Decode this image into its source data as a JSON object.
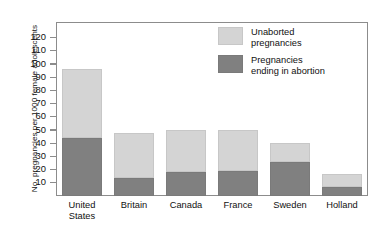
{
  "chart_data": {
    "type": "bar",
    "subtype": "stacked-bar",
    "title": "",
    "xlabel": "",
    "ylabel": "No. pregnancies per 1000 female adolescents",
    "ylim": [
      0,
      125
    ],
    "yticks": [
      10,
      20,
      30,
      40,
      50,
      60,
      70,
      80,
      90,
      100,
      110,
      120
    ],
    "ytick_labels": [
      "10",
      "20",
      "30",
      "40",
      "50",
      "60",
      "70",
      "80",
      "90",
      "100",
      "110",
      "120"
    ],
    "grid": false,
    "legend_position": "upper right (inside plot area)",
    "categories": [
      "United States",
      "Britain",
      "Canada",
      "France",
      "Sweden",
      "Holland"
    ],
    "category_label_lines": [
      [
        "United",
        "States"
      ],
      [
        "Britain",
        ""
      ],
      [
        "Canada",
        ""
      ],
      [
        "France",
        ""
      ],
      [
        "Sweden",
        ""
      ],
      [
        "Holland",
        ""
      ]
    ],
    "series": [
      {
        "name": "Pregnancies ending in abortion",
        "color": "#808080",
        "legend_label_lines": [
          "Pregnancies",
          "ending in abortion"
        ],
        "values": [
          44,
          14,
          18,
          19,
          26,
          7
        ]
      },
      {
        "name": "Unaborted pregnancies",
        "color": "#d4d4d4",
        "legend_label_lines": [
          "Unaborted",
          "pregnancies"
        ],
        "values": [
          52,
          34,
          32,
          31,
          14,
          10
        ]
      }
    ],
    "totals": [
      96,
      48,
      50,
      50,
      40,
      17
    ]
  },
  "legend": {
    "items": [
      {
        "line1": "Unaborted",
        "line2": "pregnancies",
        "color": "#d4d4d4"
      },
      {
        "line1": "Pregnancies",
        "line2": "ending in abortion",
        "color": "#808080"
      }
    ]
  },
  "axes": {
    "y_title": "No. pregnancies per 1000 female adolescents",
    "frame_color": "#8c8c8c"
  }
}
